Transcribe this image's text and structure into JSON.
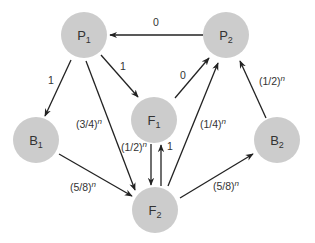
{
  "diagram": {
    "type": "directed-graph",
    "nodes": [
      {
        "id": "P1",
        "base": "P",
        "sub": "1",
        "x": 84,
        "y": 35
      },
      {
        "id": "P2",
        "base": "P",
        "sub": "2",
        "x": 226,
        "y": 35
      },
      {
        "id": "F1",
        "base": "F",
        "sub": "1",
        "x": 154,
        "y": 120
      },
      {
        "id": "B1",
        "base": "B",
        "sub": "1",
        "x": 36,
        "y": 140
      },
      {
        "id": "B2",
        "base": "B",
        "sub": "2",
        "x": 277,
        "y": 140
      },
      {
        "id": "F2",
        "base": "F",
        "sub": "2",
        "x": 155,
        "y": 210
      }
    ],
    "edges": [
      {
        "from": "P2",
        "to": "P1",
        "label": "0",
        "exp": ""
      },
      {
        "from": "P1",
        "to": "B1",
        "label": "1",
        "exp": ""
      },
      {
        "from": "P1",
        "to": "F1",
        "label": "1",
        "exp": ""
      },
      {
        "from": "P1",
        "to": "F2",
        "label": "(3/4)",
        "exp": "n"
      },
      {
        "from": "F1",
        "to": "P2",
        "label": "0",
        "exp": ""
      },
      {
        "from": "B2",
        "to": "P2",
        "label": "(1/2)",
        "exp": "n"
      },
      {
        "from": "F2",
        "to": "P2",
        "label": "(1/4)",
        "exp": "n"
      },
      {
        "from": "F1",
        "to": "F2",
        "label": "(1/2)",
        "exp": "n"
      },
      {
        "from": "F2",
        "to": "F1",
        "label": "1",
        "exp": ""
      },
      {
        "from": "B1",
        "to": "F2",
        "label": "(5/8)",
        "exp": "n"
      },
      {
        "from": "F2",
        "to": "B2",
        "label": "(5/8)",
        "exp": "n"
      }
    ]
  }
}
